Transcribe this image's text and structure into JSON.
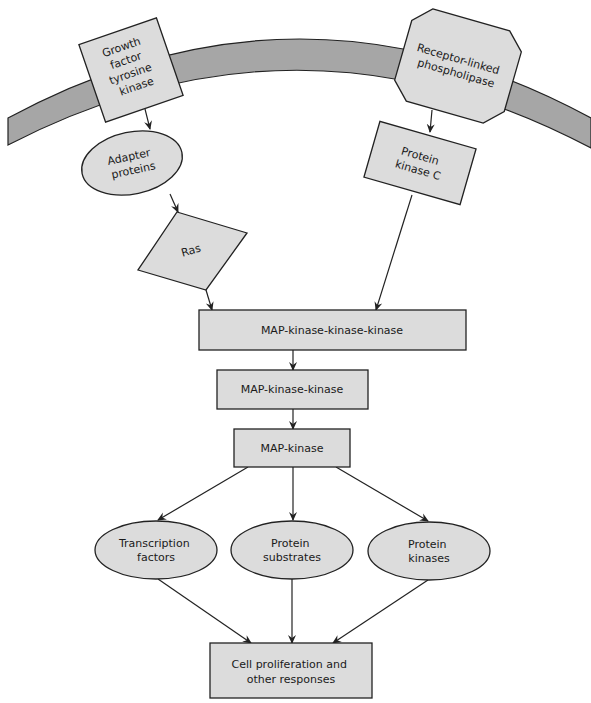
{
  "diagram": {
    "type": "signaling-pathway",
    "colors": {
      "node_fill": "#dcdcdc",
      "node_stroke": "#222222",
      "membrane_fill": "#a6a6a6",
      "arrow": "#222222",
      "background": "#ffffff"
    },
    "nodes": {
      "gf_tyrosine_kinase": {
        "lines": [
          "Growth",
          "factor",
          "tyrosine",
          "kinase"
        ],
        "shape": "rotated-square"
      },
      "receptor_phospholipase": {
        "lines": [
          "Receptor-linked",
          "phospholipase"
        ],
        "shape": "octagon"
      },
      "adapter_proteins": {
        "lines": [
          "Adapter",
          "proteins"
        ],
        "shape": "ellipse"
      },
      "protein_kinase_c": {
        "lines": [
          "Protein",
          "kinase C"
        ],
        "shape": "rotated-rectangle"
      },
      "ras": {
        "lines": [
          "Ras"
        ],
        "shape": "diamond"
      },
      "mapkkk": {
        "lines": [
          "MAP-kinase-kinase-kinase"
        ],
        "shape": "rectangle"
      },
      "mapkk": {
        "lines": [
          "MAP-kinase-kinase"
        ],
        "shape": "rectangle"
      },
      "mapk": {
        "lines": [
          "MAP-kinase"
        ],
        "shape": "rectangle"
      },
      "transcription_factors": {
        "lines": [
          "Transcription",
          "factors"
        ],
        "shape": "ellipse"
      },
      "protein_substrates": {
        "lines": [
          "Protein",
          "substrates"
        ],
        "shape": "ellipse"
      },
      "protein_kinases": {
        "lines": [
          "Protein",
          "kinases"
        ],
        "shape": "ellipse"
      },
      "cell_proliferation": {
        "lines": [
          "Cell proliferation and",
          "other responses"
        ],
        "shape": "rectangle"
      }
    },
    "edges": [
      {
        "from": "gf_tyrosine_kinase",
        "to": "adapter_proteins"
      },
      {
        "from": "adapter_proteins",
        "to": "ras"
      },
      {
        "from": "ras",
        "to": "mapkkk"
      },
      {
        "from": "receptor_phospholipase",
        "to": "protein_kinase_c"
      },
      {
        "from": "protein_kinase_c",
        "to": "mapkkk"
      },
      {
        "from": "mapkkk",
        "to": "mapkk"
      },
      {
        "from": "mapkk",
        "to": "mapk"
      },
      {
        "from": "mapk",
        "to": "transcription_factors"
      },
      {
        "from": "mapk",
        "to": "protein_substrates"
      },
      {
        "from": "mapk",
        "to": "protein_kinases"
      },
      {
        "from": "transcription_factors",
        "to": "cell_proliferation"
      },
      {
        "from": "protein_substrates",
        "to": "cell_proliferation"
      },
      {
        "from": "protein_kinases",
        "to": "cell_proliferation"
      }
    ]
  }
}
